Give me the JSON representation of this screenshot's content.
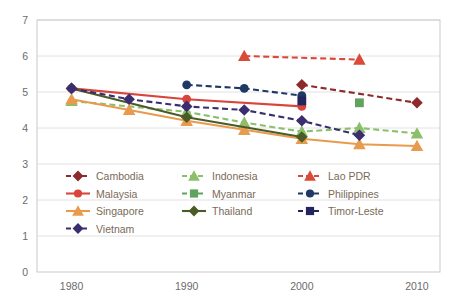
{
  "chart_data": {
    "type": "line",
    "title": "",
    "subtitle": "",
    "xlabel": "",
    "ylabel": "",
    "xlim": [
      1977,
      2012
    ],
    "ylim": [
      0,
      7
    ],
    "x_ticks": [
      1980,
      1990,
      2000,
      2010
    ],
    "y_ticks": [
      0,
      1,
      2,
      3,
      4,
      5,
      6,
      7
    ],
    "grid": "horizontal",
    "legend_position": "inside-lower-left",
    "legend_columns": 3,
    "series": [
      {
        "name": "Cambodia",
        "color": "#8E2A2B",
        "dash": "dashed",
        "marker": "diamond",
        "x": [
          2000,
          2010
        ],
        "values": [
          5.2,
          4.7
        ]
      },
      {
        "name": "Indonesia",
        "color": "#8CBF6B",
        "dash": "dashed",
        "marker": "triangle",
        "x": [
          1980,
          1990,
          1995,
          2000,
          2005,
          2010
        ],
        "values": [
          4.75,
          4.45,
          4.15,
          3.9,
          4.0,
          3.85
        ]
      },
      {
        "name": "Lao PDR",
        "color": "#D94A38",
        "dash": "dashed",
        "marker": "triangle",
        "x": [
          1995,
          2005
        ],
        "values": [
          6.0,
          5.9
        ]
      },
      {
        "name": "Malaysia",
        "color": "#D9453B",
        "dash": "solid",
        "marker": "circle",
        "x": [
          1980,
          1990,
          2000
        ],
        "values": [
          5.1,
          4.8,
          4.6
        ]
      },
      {
        "name": "Myanmar",
        "color": "#5FA35F",
        "dash": "dashed",
        "marker": "square",
        "x": [
          2005
        ],
        "values": [
          4.7
        ]
      },
      {
        "name": "Philippines",
        "color": "#1F3864",
        "dash": "dashed",
        "marker": "circle",
        "x": [
          1990,
          1995,
          2000
        ],
        "values": [
          5.2,
          5.1,
          4.9
        ]
      },
      {
        "name": "Singapore",
        "color": "#E89B4C",
        "dash": "solid",
        "marker": "triangle",
        "x": [
          1980,
          1985,
          1990,
          1995,
          2000,
          2005,
          2010
        ],
        "values": [
          4.8,
          4.5,
          4.2,
          3.95,
          3.7,
          3.55,
          3.5
        ]
      },
      {
        "name": "Thailand",
        "color": "#4A5B28",
        "dash": "solid",
        "marker": "diamond",
        "x": [
          1980,
          1990,
          2000
        ],
        "values": [
          5.1,
          4.3,
          3.75
        ]
      },
      {
        "name": "Timor-Leste",
        "color": "#23255C",
        "dash": "dashed",
        "marker": "square",
        "x": [
          2000
        ],
        "values": [
          4.75
        ]
      },
      {
        "name": "Vietnam",
        "color": "#3A2E70",
        "dash": "dashed",
        "marker": "diamond",
        "x": [
          1980,
          1985,
          1990,
          1995,
          2000,
          2005
        ],
        "values": [
          5.1,
          4.8,
          4.6,
          4.5,
          4.2,
          3.8
        ]
      }
    ]
  },
  "axes": {
    "y_tick_labels": [
      "0",
      "1",
      "2",
      "3",
      "4",
      "5",
      "6",
      "7"
    ],
    "x_tick_labels": [
      "1980",
      "1990",
      "2000",
      "2010"
    ]
  },
  "legend": {
    "entries": [
      {
        "label": "Cambodia",
        "color": "#8E2A2B",
        "dash": "dashed",
        "marker": "diamond"
      },
      {
        "label": "Indonesia",
        "color": "#8CBF6B",
        "dash": "dashed",
        "marker": "triangle"
      },
      {
        "label": "Lao PDR",
        "color": "#D94A38",
        "dash": "dashed",
        "marker": "triangle"
      },
      {
        "label": "Malaysia",
        "color": "#D9453B",
        "dash": "solid",
        "marker": "circle"
      },
      {
        "label": "Myanmar",
        "color": "#5FA35F",
        "dash": "dashed",
        "marker": "square"
      },
      {
        "label": "Philippines",
        "color": "#1F3864",
        "dash": "dashed",
        "marker": "circle"
      },
      {
        "label": "Singapore",
        "color": "#E89B4C",
        "dash": "solid",
        "marker": "triangle"
      },
      {
        "label": "Thailand",
        "color": "#4A5B28",
        "dash": "solid",
        "marker": "diamond"
      },
      {
        "label": "Timor-Leste",
        "color": "#23255C",
        "dash": "dashed",
        "marker": "square"
      },
      {
        "label": "Vietnam",
        "color": "#3A2E70",
        "dash": "dashed",
        "marker": "diamond"
      }
    ]
  },
  "style": {
    "plot_border_color": "#c9c9c9",
    "grid_color": "#e2e2e2",
    "background": "#ffffff",
    "tick_text_color": "#6b6b6b",
    "legend_text_color": "#7a6a58"
  }
}
